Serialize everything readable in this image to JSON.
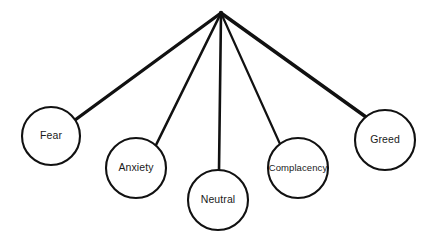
{
  "diagram": {
    "type": "fan-hierarchy",
    "background_color": "#ffffff",
    "stroke_color": "#111111",
    "text_color": "#1a1a1a",
    "canvas": {
      "width": 436,
      "height": 240
    },
    "apex": {
      "x": 221,
      "y": 13
    },
    "nodes": [
      {
        "id": "fear",
        "label": "Fear",
        "cx": 51,
        "cy": 136,
        "r": 29,
        "font_size": 10.5,
        "edge_thickness": 3.4,
        "edge_attach": {
          "x": 75,
          "y": 120
        }
      },
      {
        "id": "anxiety",
        "label": "Anxiety",
        "cx": 136,
        "cy": 168,
        "r": 30,
        "font_size": 10.5,
        "edge_thickness": 2.6,
        "edge_attach": {
          "x": 156,
          "y": 145
        }
      },
      {
        "id": "neutral",
        "label": "Neutral",
        "cx": 218,
        "cy": 200,
        "r": 30,
        "font_size": 10.5,
        "edge_thickness": 2.6,
        "edge_attach": {
          "x": 219,
          "y": 170
        }
      },
      {
        "id": "complacency",
        "label": "Complacency",
        "cx": 298,
        "cy": 168,
        "r": 30,
        "font_size": 9.5,
        "edge_thickness": 2.2,
        "edge_attach": {
          "x": 280,
          "y": 144
        }
      },
      {
        "id": "greed",
        "label": "Greed",
        "cx": 385,
        "cy": 140,
        "r": 30,
        "font_size": 10.5,
        "edge_thickness": 3.4,
        "edge_attach": {
          "x": 366,
          "y": 117
        }
      }
    ],
    "circle_stroke_width": 2.1
  }
}
